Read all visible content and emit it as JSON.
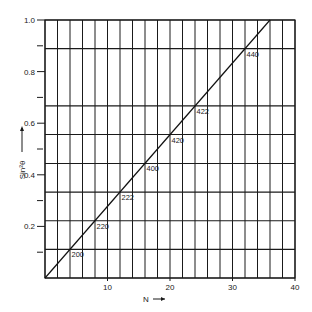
{
  "chart_data": {
    "type": "line",
    "title": "",
    "xlabel": "N",
    "ylabel": "Sin²θ",
    "xlim": [
      0,
      40
    ],
    "ylim": [
      0,
      1.0
    ],
    "x_ticks": [
      10,
      20,
      30,
      40
    ],
    "y_ticks": [
      0.2,
      0.4,
      0.6,
      0.8,
      1.0
    ],
    "y_minor_ticks": [
      0.1,
      0.3,
      0.5,
      0.7,
      0.9
    ],
    "grid": {
      "vertical_every_N": 2,
      "horizontal_at_reflections": true
    },
    "line": {
      "x": [
        0,
        36
      ],
      "y": [
        0,
        1.0
      ]
    },
    "points": [
      {
        "label": "200",
        "N": 4,
        "sin2theta": 0.111
      },
      {
        "label": "220",
        "N": 8,
        "sin2theta": 0.222
      },
      {
        "label": "222",
        "N": 12,
        "sin2theta": 0.333
      },
      {
        "label": "400",
        "N": 16,
        "sin2theta": 0.444
      },
      {
        "label": "420",
        "N": 20,
        "sin2theta": 0.556
      },
      {
        "label": "422",
        "N": 24,
        "sin2theta": 0.667
      },
      {
        "label": "440",
        "N": 32,
        "sin2theta": 0.889
      }
    ],
    "x_axis_label": "N →",
    "y_axis_label": "Sin²θ →"
  },
  "labels": {
    "x_axis": "N",
    "y_axis": "Sin²θ"
  }
}
